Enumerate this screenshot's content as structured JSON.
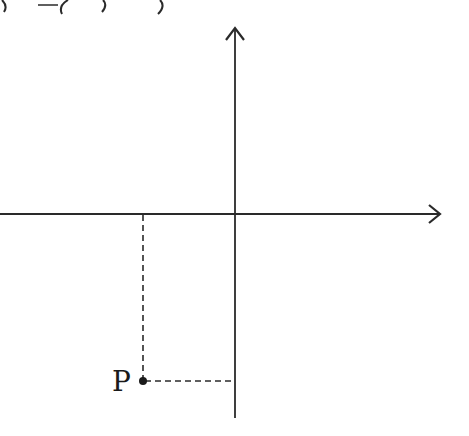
{
  "header": {
    "partial_text": ") = (   ,   )"
  },
  "diagram": {
    "stroke_color": "#2a2a2a",
    "axes": {
      "origin": [
        235,
        214
      ],
      "x_axis": {
        "from": [
          0,
          214
        ],
        "to": [
          440,
          214
        ],
        "arrow": "right"
      },
      "y_axis": {
        "from": [
          235,
          418
        ],
        "to": [
          235,
          28
        ],
        "arrow": "up"
      }
    },
    "point": {
      "label": "P",
      "position": [
        143,
        381
      ],
      "quadrant": "III"
    },
    "dashed_lines": [
      {
        "name": "vertical-projection",
        "from": [
          143,
          214
        ],
        "to": [
          143,
          381
        ]
      },
      {
        "name": "horizontal-projection",
        "from": [
          143,
          381
        ],
        "to": [
          235,
          381
        ]
      }
    ]
  }
}
